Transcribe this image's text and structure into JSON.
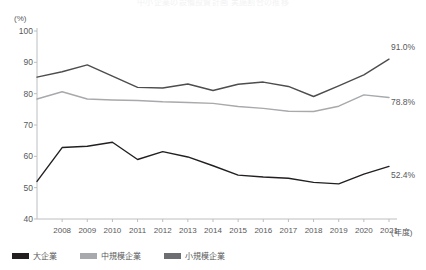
{
  "figure": {
    "cut_title": "中小企業の設備投資計画 実施割合の推移",
    "unit_label": "(%)",
    "x_unit_label": "(年度)"
  },
  "chart_data": {
    "type": "line",
    "title": "",
    "xlabel": "(年度)",
    "ylabel": "(%)",
    "ylim": [
      40,
      100
    ],
    "ytick_step": 10,
    "yticks": [
      40,
      50,
      60,
      70,
      80,
      90,
      100
    ],
    "grid": false,
    "legend_position": "bottom-left",
    "x": [
      2007,
      2008,
      2009,
      2010,
      2011,
      2012,
      2013,
      2014,
      2015,
      2016,
      2017,
      2018,
      2019,
      2020,
      2021
    ],
    "categories": [
      "",
      "2008",
      "2009",
      "2010",
      "2011",
      "2012",
      "2013",
      "2014",
      "2015",
      "2016",
      "2017",
      "2018",
      "2019",
      "2020",
      "2021"
    ],
    "xtick_labels": [
      "2008",
      "2009",
      "2010",
      "2011",
      "2012",
      "2013",
      "2014",
      "2015",
      "2016",
      "2017",
      "2018",
      "2019",
      "2020",
      "2021"
    ],
    "series": [
      {
        "name": "大企業",
        "color": "#4d4d4f",
        "values": [
          85.3,
          87.0,
          89.2,
          85.6,
          82.0,
          81.8,
          83.1,
          81.0,
          83.0,
          83.7,
          82.3,
          79.1,
          82.5,
          86.0,
          91.0
        ],
        "end_label": "91.0%"
      },
      {
        "name": "中規模企業",
        "color": "#a7a9ac",
        "values": [
          78.3,
          80.6,
          78.3,
          78.0,
          77.8,
          77.4,
          77.2,
          76.9,
          75.9,
          75.3,
          74.4,
          74.3,
          76.0,
          79.6,
          78.8
        ],
        "end_label": "78.8%"
      },
      {
        "name": "小規模企業",
        "color": "#231f20",
        "values": [
          52.0,
          62.8,
          63.2,
          64.5,
          59.0,
          61.5,
          59.8,
          57.0,
          54.0,
          53.4,
          53.0,
          51.7,
          51.2,
          54.3,
          56.8
        ],
        "end_label": "52.4%"
      }
    ],
    "end_labels": [
      {
        "series": "大企業",
        "text": "91.0%"
      },
      {
        "series": "中規模企業",
        "text": "78.8%"
      },
      {
        "series": "小規模企業",
        "text": "52.4%"
      }
    ]
  },
  "legend": {
    "items": [
      {
        "label": "大企業",
        "color": "#231f20"
      },
      {
        "label": "中規模企業",
        "color": "#a7a9ac"
      },
      {
        "label": "小規模企業",
        "color": "#6d6e71"
      }
    ]
  }
}
